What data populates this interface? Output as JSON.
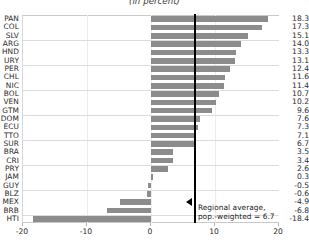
{
  "chart_data": {
    "type": "bar",
    "orientation": "horizontal",
    "title": "(in percent)",
    "xlabel": "",
    "ylabel": "",
    "xlim": [
      -20,
      20
    ],
    "xticks": [
      -20,
      -10,
      0,
      10,
      20
    ],
    "xtick_labels": [
      "-20",
      "-10",
      "0",
      "10",
      "20"
    ],
    "grid": true,
    "legend": null,
    "bar_color": "#8c8c8c",
    "reference_line": {
      "value": 6.7,
      "color": "#000000",
      "label_line1": "Regional average,",
      "label_line2": "pop.-weighted = 6.7"
    },
    "categories": [
      "PAN",
      "COL",
      "SLV",
      "ARG",
      "HND",
      "URY",
      "PER",
      "CHL",
      "NIC",
      "BOL",
      "VEN",
      "GTM",
      "DOM",
      "ECU",
      "TTO",
      "SUR",
      "BRA",
      "CRI",
      "PRY",
      "JAM",
      "GUY",
      "BLZ",
      "MEX",
      "BRB",
      "HTI"
    ],
    "values": [
      18.3,
      17.3,
      15.1,
      14.0,
      13.3,
      13.1,
      12.4,
      11.6,
      11.4,
      10.7,
      10.2,
      9.6,
      7.6,
      7.3,
      7.1,
      6.7,
      3.5,
      3.4,
      2.6,
      0.3,
      -0.5,
      -0.6,
      -4.9,
      -6.8,
      -18.4
    ],
    "value_labels": [
      "18.3",
      "17.3",
      "15.1",
      "14.0",
      "13.3",
      "13.1",
      "12.4",
      "11.6",
      "11.4",
      "10.7",
      "10.2",
      "9.6",
      "7.6",
      "7.3",
      "7.1",
      "6.7",
      "3.5",
      "3.4",
      "2.6",
      "0.3",
      "-0.5",
      "-0.6",
      "-4.9",
      "-6.8",
      "-18.4"
    ]
  }
}
